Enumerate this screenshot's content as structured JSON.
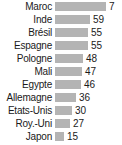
{
  "chart_data": {
    "type": "bar",
    "orientation": "horizontal",
    "title": "",
    "subtitle": "",
    "xlabel": "",
    "ylabel": "",
    "grid": false,
    "legend": null,
    "value_labels": true,
    "bar_color": "#b4b4b4",
    "text_color": "#1a1a1a",
    "background": "#ffffff",
    "xlim": [
      0,
      71
    ],
    "categories": [
      "Maroc",
      "Inde",
      "Brésil",
      "Espagne",
      "Pologne",
      "Mali",
      "Egypte",
      "Allemagne",
      "Etats-Unis",
      "Roy.-Uni",
      "Japon"
    ],
    "values": [
      71,
      59,
      55,
      55,
      48,
      47,
      46,
      36,
      30,
      27,
      15
    ],
    "rows": [
      {
        "label": "Maroc",
        "value": 71,
        "value_text": "7",
        "bar_px": 51
      },
      {
        "label": "Inde",
        "value": 59,
        "value_text": "59",
        "bar_px": 35
      },
      {
        "label": "Brésil",
        "value": 55,
        "value_text": "55",
        "bar_px": 33
      },
      {
        "label": "Espagne",
        "value": 55,
        "value_text": "55",
        "bar_px": 33
      },
      {
        "label": "Pologne",
        "value": 48,
        "value_text": "48",
        "bar_px": 28
      },
      {
        "label": "Mali",
        "value": 47,
        "value_text": "47",
        "bar_px": 27
      },
      {
        "label": "Egypte",
        "value": 46,
        "value_text": "46",
        "bar_px": 26
      },
      {
        "label": "Allemagne",
        "value": 36,
        "value_text": "36",
        "bar_px": 21
      },
      {
        "label": "Etats-Unis",
        "value": 30,
        "value_text": "30",
        "bar_px": 17
      },
      {
        "label": "Roy.-Uni",
        "value": 27,
        "value_text": "27",
        "bar_px": 15
      },
      {
        "label": "Japon",
        "value": 15,
        "value_text": "15",
        "bar_px": 9
      }
    ]
  }
}
